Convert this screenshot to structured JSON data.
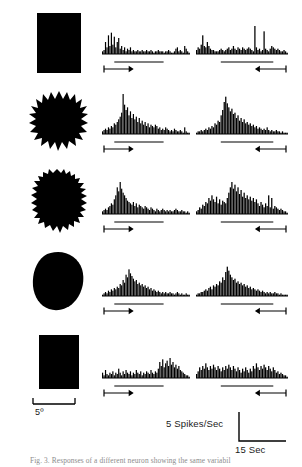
{
  "figure": {
    "caption": "Fig. 3.  Responses of a different neuron showing the same variabil",
    "background_color": "#ffffff",
    "ink_color": "#000000"
  },
  "scales": {
    "visual_angle": {
      "label": "5º",
      "icon": "bracket-scale-icon"
    },
    "rate": {
      "label": "5 Spikes/Sec"
    },
    "time": {
      "label": "15 Sec"
    }
  },
  "direction_markers": {
    "left_column": {
      "name": "rightward-arrow-icon",
      "direction": "right"
    },
    "right_column": {
      "name": "leftward-arrow-icon",
      "direction": "left"
    }
  },
  "chart_data": {
    "type": "bar",
    "xlabel": "Time",
    "ylabel": "Spikes/Sec",
    "ylim": [
      0,
      30
    ],
    "grid": false,
    "legend_position": "bottom-right",
    "bin_count": 60,
    "columns": [
      {
        "name": "leftward-to-rightward-sweep",
        "direction": "right",
        "marker": "→"
      },
      {
        "name": "rightward-to-leftward-sweep",
        "direction": "left",
        "marker": "←"
      }
    ],
    "rows": [
      {
        "stimulus": "solid-rectangle",
        "stimulus_label": "Rectangle",
        "series": [
          {
            "name": "row1-rightward",
            "values": [
              2,
              3,
              9,
              5,
              14,
              6,
              16,
              7,
              13,
              5,
              9,
              12,
              4,
              6,
              3,
              5,
              2,
              4,
              3,
              5,
              2,
              3,
              2,
              2,
              3,
              2,
              2,
              3,
              2,
              2,
              3,
              2,
              2,
              3,
              2,
              1,
              2,
              2,
              3,
              2,
              2,
              2,
              1,
              2,
              2,
              3,
              2,
              1,
              1,
              2,
              4,
              5,
              2,
              3,
              2,
              1,
              6,
              4,
              2,
              1
            ]
          },
          {
            "name": "row1-leftward",
            "values": [
              3,
              5,
              4,
              7,
              14,
              6,
              5,
              9,
              6,
              4,
              3,
              3,
              2,
              2,
              2,
              3,
              4,
              3,
              2,
              3,
              4,
              5,
              3,
              4,
              6,
              4,
              3,
              5,
              4,
              3,
              5,
              4,
              3,
              4,
              5,
              4,
              3,
              2,
              21,
              5,
              3,
              4,
              2,
              3,
              17,
              4,
              3,
              2,
              4,
              6,
              5,
              4,
              3,
              4,
              3,
              2,
              2,
              3,
              2,
              1
            ]
          }
        ]
      },
      {
        "stimulus": "star-jagged-shape",
        "stimulus_label": "Star",
        "series": [
          {
            "name": "row2-rightward",
            "values": [
              2,
              3,
              4,
              3,
              5,
              4,
              6,
              5,
              8,
              7,
              9,
              11,
              13,
              16,
              30,
              22,
              18,
              20,
              14,
              17,
              12,
              15,
              11,
              13,
              9,
              12,
              8,
              10,
              7,
              9,
              6,
              8,
              5,
              7,
              6,
              5,
              7,
              6,
              4,
              5,
              3,
              4,
              3,
              5,
              4,
              3,
              2,
              3,
              2,
              4,
              3,
              2,
              2,
              3,
              2,
              1,
              5,
              2,
              1,
              1
            ]
          },
          {
            "name": "row2-leftward",
            "values": [
              1,
              2,
              2,
              3,
              2,
              3,
              4,
              3,
              5,
              4,
              6,
              5,
              8,
              7,
              10,
              9,
              14,
              18,
              24,
              28,
              23,
              20,
              17,
              19,
              15,
              16,
              12,
              14,
              10,
              12,
              9,
              11,
              8,
              9,
              7,
              8,
              6,
              7,
              5,
              6,
              4,
              5,
              4,
              3,
              4,
              3,
              5,
              3,
              2,
              3,
              2,
              2,
              3,
              2,
              2,
              1,
              2,
              1,
              1,
              1
            ]
          }
        ]
      },
      {
        "stimulus": "irregular-rough-blob",
        "stimulus_label": "Irregular blob",
        "series": [
          {
            "name": "row3-rightward",
            "values": [
              2,
              3,
              4,
              3,
              5,
              6,
              8,
              7,
              11,
              14,
              20,
              17,
              24,
              19,
              16,
              14,
              12,
              10,
              9,
              8,
              7,
              9,
              6,
              8,
              5,
              7,
              6,
              5,
              4,
              6,
              5,
              4,
              3,
              5,
              4,
              3,
              2,
              4,
              3,
              2,
              3,
              4,
              3,
              2,
              3,
              2,
              3,
              2,
              2,
              3,
              4,
              3,
              2,
              2,
              3,
              2,
              2,
              1,
              2,
              1
            ]
          },
          {
            "name": "row3-leftward",
            "values": [
              2,
              3,
              5,
              4,
              7,
              6,
              9,
              8,
              12,
              10,
              14,
              11,
              9,
              13,
              8,
              11,
              7,
              10,
              9,
              8,
              12,
              16,
              20,
              24,
              19,
              22,
              17,
              20,
              15,
              18,
              13,
              16,
              12,
              14,
              11,
              13,
              10,
              12,
              9,
              11,
              8,
              6,
              9,
              7,
              5,
              8,
              6,
              14,
              5,
              12,
              4,
              6,
              5,
              4,
              3,
              4,
              3,
              2,
              2,
              1
            ]
          }
        ]
      },
      {
        "stimulus": "smooth-oval",
        "stimulus_label": "Oval",
        "series": [
          {
            "name": "row4-rightward",
            "values": [
              1,
              2,
              3,
              2,
              4,
              3,
              5,
              4,
              6,
              5,
              7,
              6,
              9,
              8,
              12,
              10,
              16,
              14,
              20,
              17,
              15,
              13,
              11,
              12,
              9,
              10,
              8,
              9,
              7,
              8,
              6,
              7,
              5,
              6,
              4,
              5,
              4,
              3,
              4,
              3,
              2,
              3,
              2,
              3,
              2,
              2,
              3,
              2,
              2,
              1,
              2,
              3,
              2,
              1,
              2,
              1,
              1,
              2,
              1,
              1
            ]
          },
          {
            "name": "row4-leftward",
            "values": [
              1,
              2,
              2,
              3,
              3,
              4,
              5,
              4,
              6,
              7,
              5,
              8,
              7,
              9,
              8,
              11,
              10,
              14,
              12,
              18,
              22,
              19,
              16,
              14,
              12,
              13,
              10,
              11,
              9,
              10,
              8,
              9,
              7,
              8,
              6,
              7,
              5,
              6,
              5,
              4,
              5,
              4,
              3,
              4,
              3,
              2,
              3,
              2,
              3,
              2,
              2,
              3,
              2,
              2,
              1,
              2,
              1,
              1,
              1,
              1
            ]
          }
        ]
      },
      {
        "stimulus": "solid-rectangle-small",
        "stimulus_label": "Rectangle",
        "series": [
          {
            "name": "row5-rightward",
            "values": [
              4,
              2,
              6,
              3,
              2,
              4,
              3,
              5,
              2,
              4,
              3,
              7,
              4,
              2,
              5,
              3,
              6,
              4,
              3,
              5,
              2,
              4,
              3,
              6,
              4,
              3,
              5,
              2,
              4,
              3,
              5,
              4,
              3,
              6,
              4,
              3,
              5,
              4,
              7,
              12,
              9,
              14,
              8,
              11,
              13,
              9,
              15,
              10,
              12,
              8,
              10,
              7,
              9,
              6,
              5,
              4,
              3,
              2,
              2,
              1
            ]
          },
          {
            "name": "row5-leftward",
            "values": [
              3,
              5,
              8,
              6,
              9,
              7,
              11,
              8,
              6,
              9,
              7,
              10,
              8,
              6,
              9,
              7,
              5,
              8,
              6,
              9,
              7,
              10,
              8,
              6,
              9,
              7,
              5,
              8,
              6,
              4,
              7,
              5,
              8,
              6,
              4,
              7,
              5,
              9,
              7,
              11,
              8,
              6,
              9,
              7,
              10,
              8,
              6,
              9,
              7,
              5,
              8,
              6,
              4,
              5,
              3,
              4,
              3,
              2,
              2,
              1
            ]
          }
        ]
      }
    ]
  }
}
